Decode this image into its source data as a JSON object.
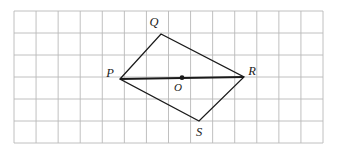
{
  "figure": {
    "kind": "geometry-diagram",
    "background_color": "#ffffff",
    "canvas": {
      "width": 337,
      "height": 152
    }
  },
  "grid": {
    "line_color": "#b9b9b9",
    "line_width": 0.9,
    "cell_size": 22.07,
    "columns": 14,
    "rows": 6,
    "origin_x": 14,
    "origin_y": 11,
    "right_x": 323,
    "bottom_y": 143
  },
  "shape": {
    "name": "PQRS",
    "stroke_color": "#1a1a1a",
    "stroke_width": 1.25,
    "vertices": [
      {
        "label": "P",
        "x": 120,
        "y": 79
      },
      {
        "label": "Q",
        "x": 161,
        "y": 34
      },
      {
        "label": "R",
        "x": 244,
        "y": 77
      },
      {
        "label": "S",
        "x": 199,
        "y": 121
      }
    ]
  },
  "diagonal": {
    "name": "PR",
    "from": "P",
    "to": "R",
    "x1": 120,
    "y1": 79,
    "x2": 244,
    "y2": 77,
    "stroke_color": "#1a1a1a",
    "stroke_width": 2.1
  },
  "center_point": {
    "label": "O",
    "x": 182,
    "y": 77.7,
    "radius": 2.4,
    "fill": "#1a1a1a"
  },
  "labels": {
    "P": {
      "text": "P",
      "x": 110,
      "y": 77
    },
    "Q": {
      "text": "Q",
      "x": 154,
      "y": 26
    },
    "R": {
      "text": "R",
      "x": 252,
      "y": 75
    },
    "S": {
      "text": "S",
      "x": 199,
      "y": 136
    },
    "O": {
      "text": "O",
      "x": 178,
      "y": 91
    }
  }
}
